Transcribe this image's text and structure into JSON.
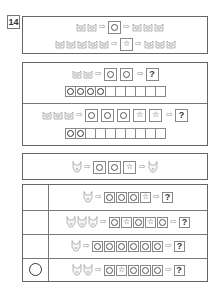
{
  "problem_number": "14",
  "icons": {
    "cat": "cat-face-icon",
    "fox": "fox-face-icon",
    "arrow": "⇨",
    "circle": "○",
    "star": "☆",
    "question": "?"
  },
  "example": {
    "rows": [
      {
        "input": [
          "cat",
          "cat"
        ],
        "machine": "circle",
        "output": [
          "cat",
          "cat",
          "cat"
        ]
      },
      {
        "input": [
          "cat",
          "cat",
          "cat",
          "cat",
          "cat"
        ],
        "machine": "star",
        "output": [
          "cat",
          "cat",
          "cat"
        ]
      }
    ]
  },
  "section1": {
    "problems": [
      {
        "input": [
          "cat",
          "cat"
        ],
        "machines": [
          "circle",
          "circle"
        ],
        "answer": "?",
        "strip_filled": 4,
        "strip_total": 10
      },
      {
        "input": [
          "cat",
          "cat",
          "cat"
        ],
        "machines": [
          "circle",
          "circle",
          "circle",
          "star",
          "star"
        ],
        "answer": "?",
        "strip_filled": 2,
        "strip_total": 10
      }
    ]
  },
  "example2": {
    "input": [
      "fox"
    ],
    "machines": [
      "circle",
      "circle",
      "star"
    ],
    "output": [
      "fox"
    ]
  },
  "section2": {
    "rows": [
      {
        "input": [
          "fox"
        ],
        "machines": [
          "circle",
          "circle",
          "circle",
          "star"
        ],
        "answer": "?",
        "marked": false
      },
      {
        "input": [
          "fox",
          "fox",
          "fox"
        ],
        "machines": [
          "circle",
          "star",
          "circle",
          "star",
          "circle"
        ],
        "answer": "?",
        "marked": false
      },
      {
        "input": [
          "fox"
        ],
        "machines": [
          "circle",
          "circle",
          "circle",
          "circle",
          "circle",
          "circle"
        ],
        "answer": "?",
        "marked": false
      },
      {
        "input": [
          "fox",
          "fox"
        ],
        "machines": [
          "circle",
          "star",
          "circle",
          "circle",
          "circle"
        ],
        "answer": "?",
        "marked": true
      }
    ]
  }
}
